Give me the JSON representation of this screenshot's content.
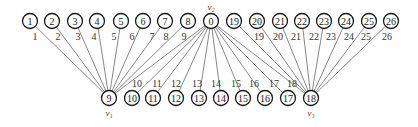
{
  "diagram": {
    "type": "graph",
    "top_nodes": [
      {
        "id": "1",
        "x": 30,
        "y": 21
      },
      {
        "id": "2",
        "x": 52,
        "y": 21
      },
      {
        "id": "3",
        "x": 75,
        "y": 21
      },
      {
        "id": "4",
        "x": 97,
        "y": 21
      },
      {
        "id": "5",
        "x": 121,
        "y": 21
      },
      {
        "id": "6",
        "x": 143,
        "y": 21
      },
      {
        "id": "7",
        "x": 165,
        "y": 21
      },
      {
        "id": "8",
        "x": 188,
        "y": 21
      },
      {
        "id": "0",
        "x": 211,
        "y": 21,
        "label": "v₂"
      },
      {
        "id": "19",
        "x": 234,
        "y": 21
      },
      {
        "id": "20",
        "x": 257,
        "y": 21
      },
      {
        "id": "21",
        "x": 280,
        "y": 21
      },
      {
        "id": "22",
        "x": 302,
        "y": 21
      },
      {
        "id": "23",
        "x": 324,
        "y": 21
      },
      {
        "id": "24",
        "x": 346,
        "y": 21
      },
      {
        "id": "25",
        "x": 369,
        "y": 21
      },
      {
        "id": "26",
        "x": 391,
        "y": 21
      }
    ],
    "bottom_nodes": [
      {
        "id": "9",
        "x": 109,
        "y": 98,
        "label": "v₁"
      },
      {
        "id": "10",
        "x": 132,
        "y": 98
      },
      {
        "id": "11",
        "x": 153,
        "y": 98
      },
      {
        "id": "12",
        "x": 176,
        "y": 98
      },
      {
        "id": "13",
        "x": 199,
        "y": 98
      },
      {
        "id": "14",
        "x": 221,
        "y": 98
      },
      {
        "id": "15",
        "x": 243,
        "y": 98
      },
      {
        "id": "16",
        "x": 265,
        "y": 98
      },
      {
        "id": "17",
        "x": 288,
        "y": 98
      },
      {
        "id": "18",
        "x": 311,
        "y": 98,
        "label": "v₃"
      }
    ],
    "edges": [
      {
        "from": "1",
        "to": "9",
        "label": "1",
        "lx": 35,
        "ly": 40
      },
      {
        "from": "2",
        "to": "9",
        "label": "2",
        "lx": 58,
        "ly": 40
      },
      {
        "from": "3",
        "to": "9",
        "label": "3",
        "lx": 78,
        "ly": 40
      },
      {
        "from": "4",
        "to": "9",
        "label": "4",
        "lx": 94,
        "ly": 40
      },
      {
        "from": "5",
        "to": "9",
        "label": "5",
        "lx": 114,
        "ly": 40
      },
      {
        "from": "6",
        "to": "9",
        "label": "6",
        "lx": 132,
        "ly": 40
      },
      {
        "from": "7",
        "to": "9",
        "label": "7",
        "lx": 152,
        "ly": 40
      },
      {
        "from": "8",
        "to": "9",
        "label": "8",
        "lx": 166,
        "ly": 40
      },
      {
        "from": "0",
        "to": "9",
        "label": "9",
        "lx": 184,
        "ly": 40
      },
      {
        "from": "0",
        "to": "10",
        "label": "10",
        "lx": 137,
        "ly": 87
      },
      {
        "from": "0",
        "to": "11",
        "label": "11",
        "lx": 157,
        "ly": 87
      },
      {
        "from": "0",
        "to": "12",
        "label": "12",
        "lx": 176,
        "ly": 87
      },
      {
        "from": "0",
        "to": "13",
        "label": "13",
        "lx": 197,
        "ly": 87
      },
      {
        "from": "0",
        "to": "14",
        "label": "14",
        "lx": 216,
        "ly": 87
      },
      {
        "from": "0",
        "to": "15",
        "label": "15",
        "lx": 236,
        "ly": 87
      },
      {
        "from": "0",
        "to": "16",
        "label": "16",
        "lx": 254,
        "ly": 87
      },
      {
        "from": "0",
        "to": "17",
        "label": "17",
        "lx": 274,
        "ly": 87
      },
      {
        "from": "0",
        "to": "18",
        "label": "18",
        "lx": 292,
        "ly": 87
      },
      {
        "from": "19",
        "to": "18",
        "label": "19",
        "lx": 259,
        "ly": 40
      },
      {
        "from": "20",
        "to": "18",
        "label": "20",
        "lx": 278,
        "ly": 40
      },
      {
        "from": "21",
        "to": "18",
        "label": "21",
        "lx": 296,
        "ly": 40
      },
      {
        "from": "22",
        "to": "18",
        "label": "22",
        "lx": 314,
        "ly": 40
      },
      {
        "from": "23",
        "to": "18",
        "label": "23",
        "lx": 331,
        "ly": 40
      },
      {
        "from": "24",
        "to": "18",
        "label": "24",
        "lx": 349,
        "ly": 40
      },
      {
        "from": "25",
        "to": "18",
        "label": "25",
        "lx": 366,
        "ly": 40
      },
      {
        "from": "26",
        "to": "18",
        "label": "26",
        "lx": 387,
        "ly": 40
      }
    ]
  }
}
